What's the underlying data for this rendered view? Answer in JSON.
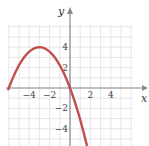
{
  "chart_data": {
    "type": "line",
    "title": "",
    "xlabel": "x",
    "ylabel": "y",
    "xlim": [
      -6.2,
      6.2
    ],
    "ylim": [
      -5.8,
      6.3
    ],
    "grid": true,
    "grid_step": 1,
    "x_ticks": [
      {
        "value": -4,
        "label": "−4"
      },
      {
        "value": -2,
        "label": "−2"
      },
      {
        "value": 2,
        "label": "2"
      },
      {
        "value": 4,
        "label": "4"
      }
    ],
    "y_ticks": [
      {
        "value": 4,
        "label": "4"
      },
      {
        "value": 2,
        "label": "2"
      },
      {
        "value": -2,
        "label": "−2"
      },
      {
        "value": -4,
        "label": "−4"
      }
    ],
    "series": [
      {
        "name": "y = -(4/9)x(x+6)",
        "color": "#c0504d",
        "function": {
          "a": -0.4444,
          "root1": -6,
          "root2": 0
        },
        "x_range": [
          -6.05,
          1.65
        ],
        "key_points": [
          {
            "x": -6,
            "y": 0
          },
          {
            "x": -3,
            "y": 4
          },
          {
            "x": 0,
            "y": 0
          }
        ]
      }
    ]
  }
}
